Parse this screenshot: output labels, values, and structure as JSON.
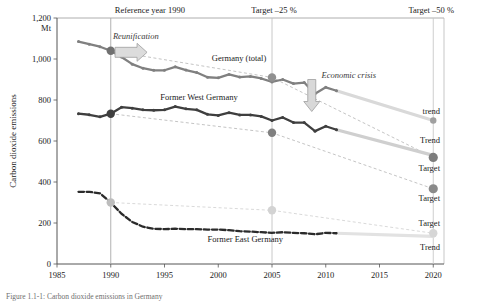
{
  "chart_data": {
    "type": "line",
    "title": "",
    "xlabel": "",
    "ylabel": "Carbon dioxide emissions",
    "yunit": "Mt",
    "xlim": [
      1985,
      2021
    ],
    "ylim": [
      0,
      1200
    ],
    "grid": false,
    "legend_position": "inline-labels",
    "xticks": [
      "1985",
      "1990",
      "1995",
      "2000",
      "2005",
      "2010",
      "2015",
      "2020"
    ],
    "yticks": [
      "0",
      "200",
      "400",
      "600",
      "800",
      "1,000",
      "1,200"
    ],
    "annotations": [
      {
        "id": "reference-year",
        "text": "Reference year 1990",
        "x": 1990
      },
      {
        "id": "target-25",
        "text": "Target –25 %",
        "x": 2005
      },
      {
        "id": "target-50",
        "text": "Target –50 %",
        "x": 2020
      },
      {
        "id": "reunification",
        "text": "Reunification",
        "x": 1991.5
      },
      {
        "id": "economic-crisis",
        "text": "Economic crisis",
        "x": 2009
      }
    ],
    "series": [
      {
        "name": "Germany (total)",
        "color": "#808080",
        "style": "solid",
        "x": [
          1987,
          1988,
          1989,
          1990,
          1991,
          1992,
          1993,
          1994,
          1995,
          1996,
          1997,
          1998,
          1999,
          2000,
          2001,
          2002,
          2003,
          2004,
          2005,
          2006,
          2007,
          2008,
          2009,
          2010,
          2011
        ],
        "values": [
          1085,
          1072,
          1060,
          1040,
          1010,
          975,
          955,
          945,
          945,
          962,
          946,
          934,
          911,
          908,
          925,
          912,
          915,
          905,
          888,
          900,
          880,
          885,
          830,
          862,
          845
        ]
      },
      {
        "name": "Former West Germany",
        "color": "#3f3f3f",
        "style": "solid",
        "x": [
          1987,
          1988,
          1989,
          1990,
          1991,
          1992,
          1993,
          1994,
          1995,
          1996,
          1997,
          1998,
          1999,
          2000,
          2001,
          2002,
          2003,
          2004,
          2005,
          2006,
          2007,
          2008,
          2009,
          2010,
          2011
        ],
        "values": [
          733,
          728,
          718,
          733,
          765,
          760,
          752,
          750,
          752,
          768,
          757,
          752,
          730,
          725,
          738,
          727,
          727,
          720,
          700,
          715,
          690,
          690,
          648,
          672,
          655
        ]
      },
      {
        "name": "Former East Germany",
        "color": "#2b2b2b",
        "style": "dashed",
        "x": [
          1987,
          1988,
          1989,
          1990,
          1991,
          1992,
          1993,
          1994,
          1995,
          1996,
          1997,
          1998,
          1999,
          2000,
          2001,
          2002,
          2003,
          2004,
          2005,
          2006,
          2007,
          2008,
          2009,
          2010,
          2011
        ],
        "values": [
          352,
          352,
          345,
          300,
          245,
          205,
          182,
          172,
          170,
          172,
          170,
          170,
          168,
          168,
          165,
          160,
          158,
          155,
          152,
          155,
          152,
          150,
          145,
          152,
          150
        ]
      }
    ],
    "trend_lines": [
      {
        "id": "germany-total-trend",
        "label": "trend",
        "color": "#d9d9d9",
        "x": [
          2011,
          2020
        ],
        "values": [
          845,
          700
        ]
      },
      {
        "id": "west-germany-trend",
        "label": "Trend",
        "color": "#cfcfcf",
        "x": [
          2011,
          2020
        ],
        "values": [
          655,
          530
        ]
      },
      {
        "id": "east-germany-trend",
        "label": "Trend",
        "color": "#e2e2e2",
        "x": [
          2011,
          2020
        ],
        "values": [
          150,
          135
        ]
      }
    ],
    "target_paths": [
      {
        "id": "germany-total-target",
        "label": "Target",
        "color": "#b5b5b5",
        "style": "dashed",
        "x": [
          1990,
          2005,
          2020
        ],
        "values": [
          1040,
          910,
          520
        ]
      },
      {
        "id": "west-germany-target",
        "label": "Target",
        "color": "#b5b5b5",
        "style": "dashed",
        "x": [
          1990,
          2005,
          2020
        ],
        "values": [
          733,
          640,
          367
        ]
      },
      {
        "id": "east-germany-target",
        "label": "Target",
        "color": "#cfcfcf",
        "style": "dashed",
        "x": [
          1990,
          2005,
          2020
        ],
        "values": [
          300,
          262,
          150
        ]
      }
    ],
    "markers": [
      {
        "id": "marker-total-1990",
        "x": 1990,
        "y": 1040,
        "color": "#707070",
        "r": 4.2
      },
      {
        "id": "marker-west-1990",
        "x": 1990,
        "y": 733,
        "color": "#3f3f3f",
        "r": 4.2
      },
      {
        "id": "marker-east-1990",
        "x": 1990,
        "y": 300,
        "color": "#bdbdbd",
        "r": 4.2
      },
      {
        "id": "marker-total-2005",
        "x": 2005,
        "y": 910,
        "color": "#909090",
        "r": 4.2
      },
      {
        "id": "marker-west-2005",
        "x": 2005,
        "y": 640,
        "color": "#808080",
        "r": 4.2
      },
      {
        "id": "marker-east-2005",
        "x": 2005,
        "y": 262,
        "color": "#d3d3d3",
        "r": 4.2
      },
      {
        "id": "marker-total-trend-2020",
        "x": 2020,
        "y": 700,
        "color": "#a0a0a0",
        "r": 3.2
      },
      {
        "id": "marker-total-target-2020",
        "x": 2020,
        "y": 520,
        "color": "#7d7d7d",
        "r": 4.6
      },
      {
        "id": "marker-west-target-2020",
        "x": 2020,
        "y": 367,
        "color": "#8a8a8a",
        "r": 4.6
      },
      {
        "id": "marker-east-2020",
        "x": 2020,
        "y": 150,
        "color": "#d6d6d6",
        "r": 4.2
      }
    ],
    "right_labels": [
      {
        "id": "right-label-trend-total",
        "text": "trend",
        "y": 745
      },
      {
        "id": "right-label-trend-west",
        "text": "Trend",
        "y": 605
      },
      {
        "id": "right-label-target-total",
        "text": "Target",
        "y": 470
      },
      {
        "id": "right-label-target-west",
        "text": "Target",
        "y": 320
      },
      {
        "id": "right-label-target-east",
        "text": "Target",
        "y": 200
      },
      {
        "id": "right-label-trend-east",
        "text": "Trend",
        "y": 85
      }
    ]
  },
  "caption": {
    "text": "Figure 1.1-1: Carbon dioxide emissions in Germany"
  }
}
